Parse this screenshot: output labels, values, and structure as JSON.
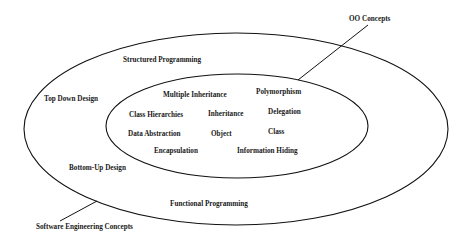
{
  "diagram": {
    "type": "nested-ellipse-concept-diagram",
    "stroke_color": "#111111",
    "text_color": "#1a1a1a",
    "background": "#ffffff",
    "outer": {
      "label": "Software Engineering Concepts",
      "items": {
        "structured_programming": "Structured Programming",
        "top_down_design": "Top Down Design",
        "bottom_up_design": "Bottom-Up Design",
        "functional_programming": "Functional Programming"
      }
    },
    "inner": {
      "label": "OO Concepts",
      "items": {
        "multiple_inheritance": "Multiple Inheritance",
        "polymorphism": "Polymorphism",
        "class_hierarchies": "Class Hierarchies",
        "inheritance": "Inheritance",
        "delegation": "Delegation",
        "data_abstraction": "Data Abstraction",
        "object": "Object",
        "class": "Class",
        "encapsulation": "Encapsulation",
        "information_hiding": "Information Hiding"
      }
    }
  }
}
